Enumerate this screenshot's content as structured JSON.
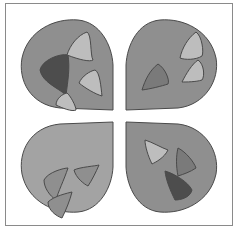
{
  "figure": {
    "type": "four-leaf visual puzzle",
    "frame": {
      "x": 5,
      "y": 3,
      "width": 227,
      "height": 222,
      "stroke": "#8a8a8a"
    },
    "colors": {
      "background": "#ffffff",
      "outline": "#4a4a4a",
      "dark": "#4d4d4d",
      "medium_dark": "#7a7a7a",
      "medium": "#8f8f8f",
      "light_medium": "#a3a3a3",
      "light": "#bdbdbd"
    },
    "leaves": [
      {
        "name": "top-left",
        "fill": "#8f8f8f",
        "path": "M113,110 L60,108 C30,105 18,80 22,58 C28,30 55,18 78,20 C100,22 112,45 113,65 Z",
        "shapes": [
          {
            "name": "dark-drop",
            "fill": "#4d4d4d",
            "path": "M68,55 C60,53 42,60 40,70 C42,82 58,88 66,95 C68,80 70,68 68,55 Z"
          },
          {
            "name": "light-drop-top",
            "fill": "#bdbdbd",
            "path": "M87,32 C92,35 90,55 93,60 C90,62 80,60 67,55 C70,45 78,35 87,32 Z"
          },
          {
            "name": "light-drop-right",
            "fill": "#bdbdbd",
            "path": "M95,70 C100,72 101,88 102,96 C95,94 85,88 79,83 C82,76 90,71 95,70 Z"
          },
          {
            "name": "light-drop-bottom",
            "fill": "#bdbdbd",
            "path": "M67,93 C70,95 76,106 76,110 C72,112 62,108 56,105 C56,99 62,94 67,93 Z"
          }
        ]
      },
      {
        "name": "top-right",
        "fill": "#8f8f8f",
        "path": "M126,110 L178,108 C205,105 220,80 216,58 C210,30 183,18 160,20 C138,22 127,45 126,65 Z",
        "shapes": [
          {
            "name": "light-drop-top",
            "fill": "#bdbdbd",
            "path": "M196,32 C202,36 204,52 202,56 C196,60 185,60 180,58 C182,48 188,38 196,32 Z"
          },
          {
            "name": "light-drop-right",
            "fill": "#bdbdbd",
            "path": "M198,60 C204,64 205,76 202,80 C196,82 186,82 182,82 C186,74 192,64 198,60 Z"
          },
          {
            "name": "medium-dark-drop-left",
            "fill": "#7a7a7a",
            "path": "M158,64 C165,68 170,80 168,84 C162,86 150,89 142,90 C145,80 150,70 158,64 Z"
          }
        ]
      },
      {
        "name": "bottom-left",
        "fill": "#a3a3a3",
        "path": "M113,122 L60,124 C30,127 18,152 22,174 C28,202 55,214 78,212 C100,210 112,187 113,167 Z",
        "shapes": [
          {
            "name": "medium-drop-left",
            "fill": "#8f8f8f",
            "path": "M68,168 C64,168 48,172 44,180 C44,188 50,196 56,200 C58,192 64,180 68,168 Z"
          },
          {
            "name": "medium-drop-right",
            "fill": "#8f8f8f",
            "path": "M99,165 C96,166 80,167 74,170 C76,178 84,184 88,186 C92,180 96,172 99,165 Z"
          },
          {
            "name": "medium-drop-bottom",
            "fill": "#8f8f8f",
            "path": "M72,192 C68,193 54,196 48,202 C48,210 56,216 62,218 C66,210 70,200 72,192 Z"
          }
        ]
      },
      {
        "name": "bottom-right",
        "fill": "#8f8f8f",
        "path": "M126,122 L178,124 C205,127 220,152 216,174 C210,202 183,214 160,212 C138,210 127,187 126,167 Z",
        "shapes": [
          {
            "name": "light-drop-left",
            "fill": "#bdbdbd",
            "path": "M145,140 C152,142 162,148 168,150 C164,158 156,162 152,164 C148,156 145,146 145,140 Z"
          },
          {
            "name": "medium-drop-right",
            "fill": "#7a7a7a",
            "path": "M178,148 C186,152 194,162 196,168 C190,172 184,174 178,176 C176,166 176,156 178,148 Z"
          },
          {
            "name": "dark-drop-bottom",
            "fill": "#4d4d4d",
            "path": "M165,171 C175,174 188,182 192,190 C190,198 180,200 175,200 C170,190 166,180 165,171 Z"
          }
        ]
      }
    ]
  }
}
